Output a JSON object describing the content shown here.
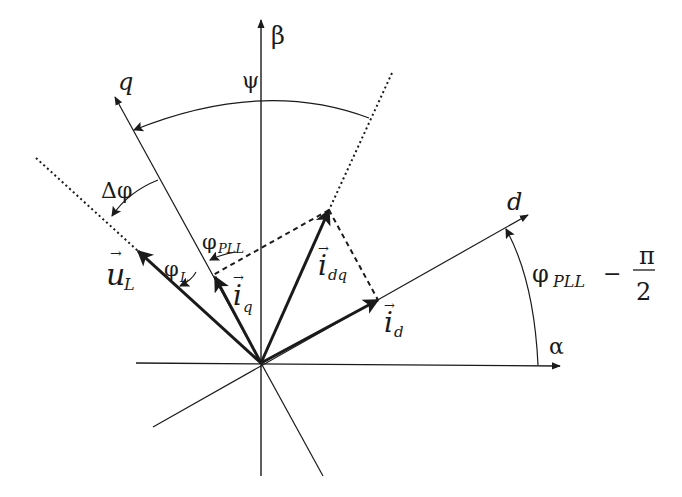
{
  "diagram": {
    "colors": {
      "stroke": "#1a1a1a",
      "background": "#ffffff"
    },
    "origin": [
      261,
      363
    ],
    "axes": {
      "alpha": {
        "label": "α"
      },
      "beta": {
        "label": "β"
      },
      "d": {
        "label": "d"
      },
      "q": {
        "label": "q"
      }
    },
    "vectors": {
      "u_L": {
        "symbol": "u",
        "sub": "L"
      },
      "i_q": {
        "symbol": "i",
        "sub": "q"
      },
      "i_dq": {
        "symbol": "i",
        "sub": "dq"
      },
      "i_d": {
        "symbol": "i",
        "sub": "d"
      }
    },
    "angles": {
      "psi": {
        "label": "ψ"
      },
      "delta_phi": {
        "label": "Δφ"
      },
      "phi_pll": {
        "label": "φ",
        "sub": "PLL"
      },
      "phi_L": {
        "label": "φ",
        "sub": "L"
      },
      "phi_pll_minus": {
        "label": "φ",
        "sub": "PLL",
        "minus": "−",
        "num": "π",
        "den": "2"
      }
    },
    "arrow_vec": "→"
  }
}
